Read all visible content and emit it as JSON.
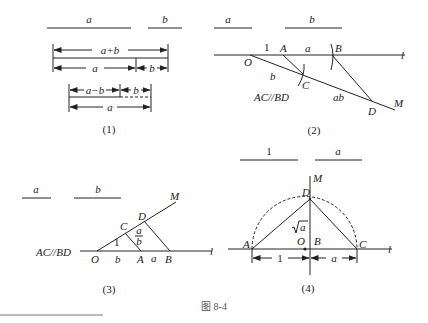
{
  "figure": {
    "caption": "图 8-4",
    "panels": [
      {
        "id": "1",
        "label": "(1)",
        "segments": {
          "a": "a",
          "b": "b"
        },
        "rows": {
          "sum": "a+b",
          "a": "a",
          "b": "b",
          "diff": "a−b",
          "b2": "b",
          "a2": "a"
        }
      },
      {
        "id": "2",
        "label": "(2)",
        "segments": {
          "a": "a",
          "b": "b"
        },
        "points": {
          "O": "O",
          "A": "A",
          "B": "B",
          "C": "C",
          "D": "D",
          "M": "M",
          "l": "l"
        },
        "lengths": {
          "OA": "1",
          "AB": "a",
          "OC": "b",
          "CD": "ab"
        },
        "note": "AC//BD"
      },
      {
        "id": "3",
        "label": "(3)",
        "segments": {
          "a": "a",
          "b": "b"
        },
        "points": {
          "O": "O",
          "A": "A",
          "B": "B",
          "C": "C",
          "D": "D",
          "M": "M",
          "l": "l"
        },
        "lengths": {
          "OC": "1",
          "OA": "b",
          "AB": "a",
          "CD_num": "a",
          "CD_den": "b"
        },
        "note": "AC//BD"
      },
      {
        "id": "4",
        "label": "(4)",
        "segments": {
          "one": "1",
          "a": "a"
        },
        "points": {
          "A": "A",
          "B": "B",
          "C": "C",
          "D": "D",
          "O": "O",
          "M": "M",
          "l": "l"
        },
        "lengths": {
          "AB": "1",
          "BC": "a",
          "BD": "√a",
          "BD_radicand": "a"
        }
      }
    ]
  }
}
